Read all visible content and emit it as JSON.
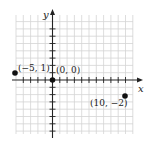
{
  "diagram": {
    "type": "coordinate-plane",
    "axes": {
      "x_label": "x",
      "y_label": "y"
    },
    "points": [
      {
        "label": "(−5, 1)",
        "x": -5,
        "y": 1
      },
      {
        "label": "(0, 0)",
        "x": 0,
        "y": 0
      },
      {
        "label": "(10, −2)",
        "x": 10,
        "y": -2
      }
    ],
    "grid": {
      "x_range": [
        -5,
        11
      ],
      "y_range": [
        -7,
        9
      ]
    },
    "colors": {
      "grid": "#d4d4d4",
      "axis": "#222222",
      "point": "#111111"
    }
  }
}
